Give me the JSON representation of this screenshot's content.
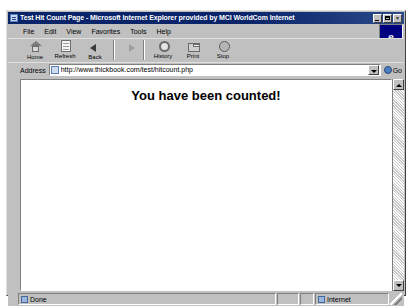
{
  "window": {
    "title": "Test Hit Count Page - Microsoft Internet Explorer provided by MCI WorldCom Internet",
    "icon": "page-icon",
    "controls": {
      "minimize": "_",
      "maximize": "□",
      "close": "×"
    },
    "brand_logo": "e"
  },
  "menu": {
    "items": [
      {
        "label": "File"
      },
      {
        "label": "Edit"
      },
      {
        "label": "View"
      },
      {
        "label": "Favorites"
      },
      {
        "label": "Tools"
      },
      {
        "label": "Help"
      }
    ]
  },
  "toolbar": {
    "buttons": [
      {
        "label": "Home",
        "icon": "home-icon"
      },
      {
        "label": "Refresh",
        "icon": "refresh-page-icon"
      },
      {
        "label": "Back",
        "icon": "back-arrow-icon"
      },
      {
        "label": "",
        "icon": "forward-arrow-icon"
      },
      {
        "label": "History",
        "icon": "history-icon"
      },
      {
        "label": "Print",
        "icon": "printer-icon"
      },
      {
        "label": "Stop",
        "icon": "stop-icon"
      }
    ]
  },
  "address": {
    "label": "Address",
    "url": "http://www.thickbook.com/test/hitcount.php",
    "placeholder": "http://",
    "icon": "page-icon",
    "dropdown": "chevron-down-icon",
    "go_label": "Go",
    "go_icon": "go-icon"
  },
  "page": {
    "heading": "You have been counted!"
  },
  "scrollbar": {
    "up": "scroll-up-arrow",
    "down": "scroll-down-arrow"
  },
  "status": {
    "message": "Done",
    "message_icon": "page-icon",
    "zone": "Internet",
    "zone_icon": "internet-zone-icon"
  },
  "colors": {
    "titlebar": "#0a246a",
    "chrome": "#c0c0c0",
    "page_bg": "#ffffff",
    "text": "#000000"
  }
}
